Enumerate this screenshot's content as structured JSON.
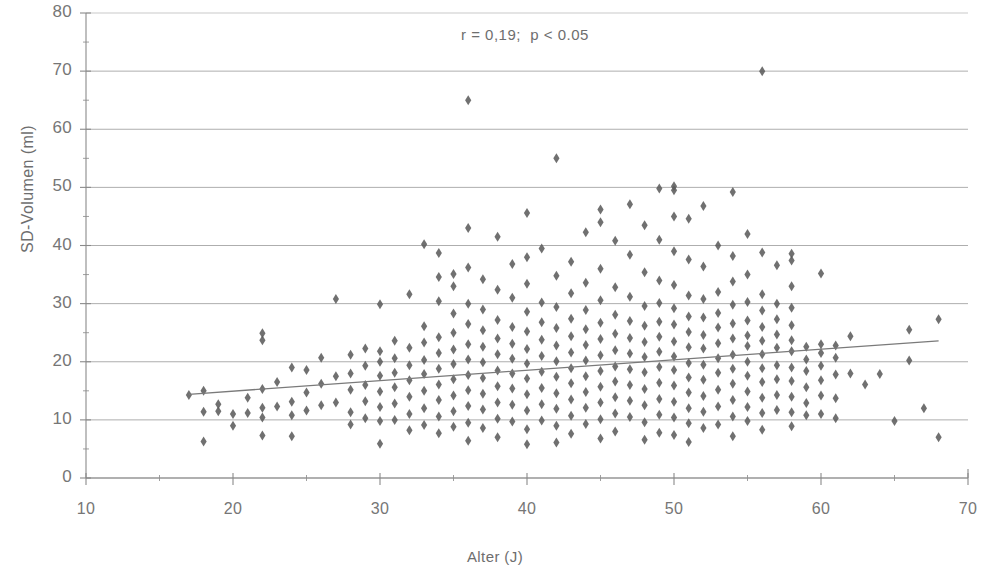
{
  "chart_data": {
    "type": "scatter",
    "title": "",
    "xlabel": "Alter (J)",
    "ylabel": "SD-Volumen (ml)",
    "xlim": [
      10,
      70
    ],
    "ylim": [
      0,
      80
    ],
    "xticks": [
      10,
      20,
      30,
      40,
      50,
      60,
      70
    ],
    "yticks": [
      0,
      10,
      20,
      30,
      40,
      50,
      60,
      70,
      80
    ],
    "xminor_step": 5,
    "yminor_step": 5,
    "grid": "horizontal",
    "legend": "none",
    "annotations": [
      {
        "text": "r = 0,19;  p < 0.05",
        "x": 38.5,
        "y": 76
      }
    ],
    "statistics": {
      "r": 0.19,
      "p_text": "p < 0.05"
    },
    "marker": {
      "shape": "diamond",
      "size": 5,
      "color": "#5c5c5c"
    },
    "trendline": {
      "type": "linear",
      "color": "#7a7a7a",
      "x_start": 17,
      "y_start": 14.4,
      "x_end": 68,
      "y_end": 23.6
    },
    "points": [
      [
        17,
        14.3
      ],
      [
        18,
        15.0
      ],
      [
        18,
        11.4
      ],
      [
        18,
        6.3
      ],
      [
        19,
        11.5
      ],
      [
        19,
        12.7
      ],
      [
        20,
        11.0
      ],
      [
        20,
        9.0
      ],
      [
        21,
        11.2
      ],
      [
        21,
        13.8
      ],
      [
        22,
        24.9
      ],
      [
        22,
        23.7
      ],
      [
        22,
        15.3
      ],
      [
        22,
        12.1
      ],
      [
        22,
        10.4
      ],
      [
        22,
        7.3
      ],
      [
        23,
        12.3
      ],
      [
        23,
        16.5
      ],
      [
        24,
        19.0
      ],
      [
        24,
        13.1
      ],
      [
        24,
        10.8
      ],
      [
        24,
        7.2
      ],
      [
        25,
        18.6
      ],
      [
        25,
        14.7
      ],
      [
        25,
        11.6
      ],
      [
        26,
        20.7
      ],
      [
        26,
        16.2
      ],
      [
        26,
        12.5
      ],
      [
        27,
        17.5
      ],
      [
        27,
        13.0
      ],
      [
        27,
        30.8
      ],
      [
        28,
        21.2
      ],
      [
        28,
        18.0
      ],
      [
        28,
        15.2
      ],
      [
        28,
        11.3
      ],
      [
        28,
        9.2
      ],
      [
        29,
        22.3
      ],
      [
        29,
        19.3
      ],
      [
        29,
        16.0
      ],
      [
        29,
        13.2
      ],
      [
        29,
        10.3
      ],
      [
        30,
        29.9
      ],
      [
        30,
        21.8
      ],
      [
        30,
        20.0
      ],
      [
        30,
        17.6
      ],
      [
        30,
        14.9
      ],
      [
        30,
        12.2
      ],
      [
        30,
        9.8
      ],
      [
        30,
        5.9
      ],
      [
        31,
        23.6
      ],
      [
        31,
        20.6
      ],
      [
        31,
        18.1
      ],
      [
        31,
        15.6
      ],
      [
        31,
        12.8
      ],
      [
        31,
        10.0
      ],
      [
        32,
        31.6
      ],
      [
        32,
        22.4
      ],
      [
        32,
        19.4
      ],
      [
        32,
        16.8
      ],
      [
        32,
        14.0
      ],
      [
        32,
        11.0
      ],
      [
        32,
        8.2
      ],
      [
        33,
        40.2
      ],
      [
        33,
        26.1
      ],
      [
        33,
        23.3
      ],
      [
        33,
        20.3
      ],
      [
        33,
        17.9
      ],
      [
        33,
        15.0
      ],
      [
        33,
        12.0
      ],
      [
        33,
        9.1
      ],
      [
        34,
        38.7
      ],
      [
        34,
        34.6
      ],
      [
        34,
        30.4
      ],
      [
        34,
        24.2
      ],
      [
        34,
        21.5
      ],
      [
        34,
        18.8
      ],
      [
        34,
        16.1
      ],
      [
        34,
        13.4
      ],
      [
        34,
        10.6
      ],
      [
        34,
        7.7
      ],
      [
        35,
        35.1
      ],
      [
        35,
        33.0
      ],
      [
        35,
        28.3
      ],
      [
        35,
        25.0
      ],
      [
        35,
        22.1
      ],
      [
        35,
        19.6
      ],
      [
        35,
        17.0
      ],
      [
        35,
        14.2
      ],
      [
        35,
        11.5
      ],
      [
        35,
        8.8
      ],
      [
        36,
        65.0
      ],
      [
        36,
        43.0
      ],
      [
        36,
        36.2
      ],
      [
        36,
        30.0
      ],
      [
        36,
        26.5
      ],
      [
        36,
        23.0
      ],
      [
        36,
        20.4
      ],
      [
        36,
        17.7
      ],
      [
        36,
        15.1
      ],
      [
        36,
        12.4
      ],
      [
        36,
        9.5
      ],
      [
        36,
        6.4
      ],
      [
        37,
        34.2
      ],
      [
        37,
        29.0
      ],
      [
        37,
        25.4
      ],
      [
        37,
        22.6
      ],
      [
        37,
        19.9
      ],
      [
        37,
        17.2
      ],
      [
        37,
        14.5
      ],
      [
        37,
        11.8
      ],
      [
        37,
        8.6
      ],
      [
        38,
        41.5
      ],
      [
        38,
        32.4
      ],
      [
        38,
        27.2
      ],
      [
        38,
        24.0
      ],
      [
        38,
        21.3
      ],
      [
        38,
        18.5
      ],
      [
        38,
        15.8
      ],
      [
        38,
        13.0
      ],
      [
        38,
        10.2
      ],
      [
        38,
        7.0
      ],
      [
        39,
        36.8
      ],
      [
        39,
        31.0
      ],
      [
        39,
        26.0
      ],
      [
        39,
        23.1
      ],
      [
        39,
        20.5
      ],
      [
        39,
        18.0
      ],
      [
        39,
        15.4
      ],
      [
        39,
        12.6
      ],
      [
        39,
        9.7
      ],
      [
        40,
        45.6
      ],
      [
        40,
        38.0
      ],
      [
        40,
        33.4
      ],
      [
        40,
        28.6
      ],
      [
        40,
        25.2
      ],
      [
        40,
        22.2
      ],
      [
        40,
        19.7
      ],
      [
        40,
        17.1
      ],
      [
        40,
        14.4
      ],
      [
        40,
        11.6
      ],
      [
        40,
        8.4
      ],
      [
        40,
        5.8
      ],
      [
        41,
        39.5
      ],
      [
        41,
        30.2
      ],
      [
        41,
        26.8
      ],
      [
        41,
        23.8
      ],
      [
        41,
        21.0
      ],
      [
        41,
        18.3
      ],
      [
        41,
        15.5
      ],
      [
        41,
        12.7
      ],
      [
        41,
        9.9
      ],
      [
        42,
        55.0
      ],
      [
        42,
        34.8
      ],
      [
        42,
        29.4
      ],
      [
        42,
        25.8
      ],
      [
        42,
        22.8
      ],
      [
        42,
        20.1
      ],
      [
        42,
        17.4
      ],
      [
        42,
        14.6
      ],
      [
        42,
        11.9
      ],
      [
        42,
        9.0
      ],
      [
        42,
        6.1
      ],
      [
        43,
        37.2
      ],
      [
        43,
        31.8
      ],
      [
        43,
        27.4
      ],
      [
        43,
        24.4
      ],
      [
        43,
        21.6
      ],
      [
        43,
        18.9
      ],
      [
        43,
        16.3
      ],
      [
        43,
        13.5
      ],
      [
        43,
        10.7
      ],
      [
        43,
        7.6
      ],
      [
        44,
        42.3
      ],
      [
        44,
        33.6
      ],
      [
        44,
        28.9
      ],
      [
        44,
        25.6
      ],
      [
        44,
        22.9
      ],
      [
        44,
        20.2
      ],
      [
        44,
        17.5
      ],
      [
        44,
        14.8
      ],
      [
        44,
        12.1
      ],
      [
        44,
        9.3
      ],
      [
        45,
        46.2
      ],
      [
        45,
        44.0
      ],
      [
        45,
        36.0
      ],
      [
        45,
        30.6
      ],
      [
        45,
        26.7
      ],
      [
        45,
        23.9
      ],
      [
        45,
        21.1
      ],
      [
        45,
        18.4
      ],
      [
        45,
        15.7
      ],
      [
        45,
        13.0
      ],
      [
        45,
        10.1
      ],
      [
        45,
        6.8
      ],
      [
        46,
        40.8
      ],
      [
        46,
        32.8
      ],
      [
        46,
        28.1
      ],
      [
        46,
        24.8
      ],
      [
        46,
        22.0
      ],
      [
        46,
        19.2
      ],
      [
        46,
        16.6
      ],
      [
        46,
        13.9
      ],
      [
        46,
        11.1
      ],
      [
        46,
        8.0
      ],
      [
        47,
        47.1
      ],
      [
        47,
        38.4
      ],
      [
        47,
        31.2
      ],
      [
        47,
        27.0
      ],
      [
        47,
        24.1
      ],
      [
        47,
        21.4
      ],
      [
        47,
        18.7
      ],
      [
        47,
        16.0
      ],
      [
        47,
        13.3
      ],
      [
        47,
        10.5
      ],
      [
        48,
        43.5
      ],
      [
        48,
        35.4
      ],
      [
        48,
        29.6
      ],
      [
        48,
        26.2
      ],
      [
        48,
        23.4
      ],
      [
        48,
        20.8
      ],
      [
        48,
        18.2
      ],
      [
        48,
        15.3
      ],
      [
        48,
        12.5
      ],
      [
        48,
        9.6
      ],
      [
        48,
        6.6
      ],
      [
        49,
        49.8
      ],
      [
        49,
        41.0
      ],
      [
        49,
        34.0
      ],
      [
        49,
        30.1
      ],
      [
        49,
        26.9
      ],
      [
        49,
        24.3
      ],
      [
        49,
        21.7
      ],
      [
        49,
        19.1
      ],
      [
        49,
        16.4
      ],
      [
        49,
        13.6
      ],
      [
        49,
        10.9
      ],
      [
        49,
        7.8
      ],
      [
        50,
        50.2
      ],
      [
        50,
        49.5
      ],
      [
        50,
        45.0
      ],
      [
        50,
        39.0
      ],
      [
        50,
        33.2
      ],
      [
        50,
        29.2
      ],
      [
        50,
        26.4
      ],
      [
        50,
        23.5
      ],
      [
        50,
        20.9
      ],
      [
        50,
        18.6
      ],
      [
        50,
        15.9
      ],
      [
        50,
        13.1
      ],
      [
        50,
        10.4
      ],
      [
        50,
        7.4
      ],
      [
        51,
        44.6
      ],
      [
        51,
        37.6
      ],
      [
        51,
        31.4
      ],
      [
        51,
        27.8
      ],
      [
        51,
        25.1
      ],
      [
        51,
        22.5
      ],
      [
        51,
        19.8
      ],
      [
        51,
        17.3
      ],
      [
        51,
        14.7
      ],
      [
        51,
        12.0
      ],
      [
        51,
        9.4
      ],
      [
        51,
        6.2
      ],
      [
        52,
        46.8
      ],
      [
        52,
        36.4
      ],
      [
        52,
        30.8
      ],
      [
        52,
        27.6
      ],
      [
        52,
        24.6
      ],
      [
        52,
        22.3
      ],
      [
        52,
        19.5
      ],
      [
        52,
        16.9
      ],
      [
        52,
        14.1
      ],
      [
        52,
        11.4
      ],
      [
        52,
        8.6
      ],
      [
        53,
        40.0
      ],
      [
        53,
        32.0
      ],
      [
        53,
        28.4
      ],
      [
        53,
        25.9
      ],
      [
        53,
        23.2
      ],
      [
        53,
        20.6
      ],
      [
        53,
        18.1
      ],
      [
        53,
        15.2
      ],
      [
        53,
        12.3
      ],
      [
        53,
        9.2
      ],
      [
        54,
        49.2
      ],
      [
        54,
        38.2
      ],
      [
        54,
        33.8
      ],
      [
        54,
        29.8
      ],
      [
        54,
        26.6
      ],
      [
        54,
        24.0
      ],
      [
        54,
        21.2
      ],
      [
        54,
        18.8
      ],
      [
        54,
        16.2
      ],
      [
        54,
        13.4
      ],
      [
        54,
        10.6
      ],
      [
        54,
        7.2
      ],
      [
        55,
        42.0
      ],
      [
        55,
        35.0
      ],
      [
        55,
        30.3
      ],
      [
        55,
        27.1
      ],
      [
        55,
        24.5
      ],
      [
        55,
        22.7
      ],
      [
        55,
        20.0
      ],
      [
        55,
        17.6
      ],
      [
        55,
        14.9
      ],
      [
        55,
        12.2
      ],
      [
        55,
        9.8
      ],
      [
        56,
        70.0
      ],
      [
        56,
        38.8
      ],
      [
        56,
        31.6
      ],
      [
        56,
        28.8
      ],
      [
        56,
        26.0
      ],
      [
        56,
        23.6
      ],
      [
        56,
        21.3
      ],
      [
        56,
        18.9
      ],
      [
        56,
        16.5
      ],
      [
        56,
        13.8
      ],
      [
        56,
        11.2
      ],
      [
        56,
        8.3
      ],
      [
        57,
        36.6
      ],
      [
        57,
        30.0
      ],
      [
        57,
        27.3
      ],
      [
        57,
        24.7
      ],
      [
        57,
        22.4
      ],
      [
        57,
        19.4
      ],
      [
        57,
        17.0
      ],
      [
        57,
        14.3
      ],
      [
        57,
        11.7
      ],
      [
        58,
        38.6
      ],
      [
        58,
        37.4
      ],
      [
        58,
        33.0
      ],
      [
        58,
        29.3
      ],
      [
        58,
        26.3
      ],
      [
        58,
        23.7
      ],
      [
        58,
        21.8
      ],
      [
        58,
        19.0
      ],
      [
        58,
        16.7
      ],
      [
        58,
        14.0
      ],
      [
        58,
        11.3
      ],
      [
        58,
        8.9
      ],
      [
        59,
        22.6
      ],
      [
        59,
        20.4
      ],
      [
        59,
        18.4
      ],
      [
        59,
        15.6
      ],
      [
        59,
        12.9
      ],
      [
        59,
        10.8
      ],
      [
        60,
        35.2
      ],
      [
        60,
        23.0
      ],
      [
        60,
        21.5
      ],
      [
        60,
        19.3
      ],
      [
        60,
        16.8
      ],
      [
        60,
        14.2
      ],
      [
        60,
        11.0
      ],
      [
        61,
        22.8
      ],
      [
        61,
        20.7
      ],
      [
        61,
        17.8
      ],
      [
        61,
        13.7
      ],
      [
        61,
        10.3
      ],
      [
        62,
        24.4
      ],
      [
        62,
        18.0
      ],
      [
        63,
        16.1
      ],
      [
        64,
        17.9
      ],
      [
        65,
        9.8
      ],
      [
        66,
        25.5
      ],
      [
        66,
        20.2
      ],
      [
        67,
        12.0
      ],
      [
        68,
        27.3
      ],
      [
        68,
        7.0
      ]
    ]
  }
}
